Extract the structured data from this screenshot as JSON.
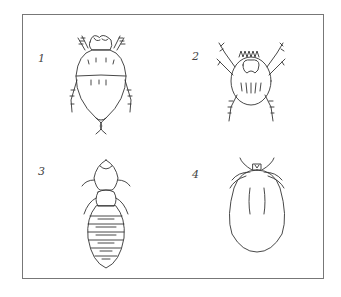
{
  "figure": {
    "panels": [
      {
        "label": "1",
        "subject": "mite-dorsal-view"
      },
      {
        "label": "2",
        "subject": "mite-with-spiny-legs"
      },
      {
        "label": "3",
        "subject": "louse-segmented-body"
      },
      {
        "label": "4",
        "subject": "engorged-tick"
      }
    ],
    "colors": {
      "line": "#333333",
      "frame": "#777777",
      "background": "#ffffff"
    }
  }
}
